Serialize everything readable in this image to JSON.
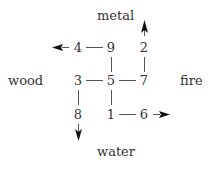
{
  "diagram": {
    "directions": {
      "top": "metal",
      "left": "wood",
      "right": "fire",
      "bottom": "water"
    },
    "grid": [
      [
        "4",
        "9",
        "2"
      ],
      [
        "3",
        "5",
        "7"
      ],
      [
        "8",
        "1",
        "6"
      ]
    ],
    "connections": [
      [
        "4",
        "9"
      ],
      [
        "9",
        "5"
      ],
      [
        "3",
        "5"
      ],
      [
        "5",
        "7"
      ],
      [
        "7",
        "2"
      ],
      [
        "3",
        "8"
      ],
      [
        "5",
        "1"
      ],
      [
        "1",
        "6"
      ]
    ],
    "arrows": [
      {
        "from": "4",
        "direction": "left"
      },
      {
        "from": "2",
        "direction": "up"
      },
      {
        "from": "8",
        "direction": "down"
      },
      {
        "from": "6",
        "direction": "right"
      }
    ]
  }
}
